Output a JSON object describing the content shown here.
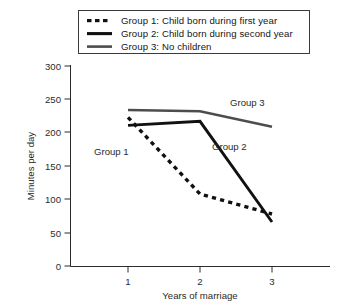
{
  "legend": {
    "items": [
      {
        "swatch": "dotted-line-swatch",
        "label": "Group 1: Child born during first year"
      },
      {
        "swatch": "solid-thick-line-swatch",
        "label": "Group 2: Child born during second year"
      },
      {
        "swatch": "solid-gray-line-swatch",
        "label": "Group 3: No children"
      }
    ]
  },
  "chart_data": {
    "type": "line",
    "title": "",
    "xlabel": "Years of marriage",
    "ylabel": "Minutes per day",
    "categories": [
      "1",
      "2",
      "3"
    ],
    "x": [
      1,
      2,
      3
    ],
    "xlim": [
      0.55,
      3.45
    ],
    "ylim": [
      0,
      300
    ],
    "yticks": [
      0,
      50,
      100,
      150,
      200,
      250,
      300
    ],
    "xticks": [
      "1",
      "2",
      "3"
    ],
    "grid": false,
    "legend_position": "top",
    "series": [
      {
        "name": "Group 1: Child born during first year",
        "short_name": "Group 1",
        "style": "dotted",
        "color": "#111111",
        "values": [
          223,
          108,
          78
        ]
      },
      {
        "name": "Group 2: Child born during second year",
        "short_name": "Group 2",
        "style": "solid",
        "color": "#111111",
        "values": [
          211,
          217,
          66
        ]
      },
      {
        "name": "Group 3: No children",
        "short_name": "Group 3",
        "style": "solid",
        "color": "#4d4d4d",
        "values": [
          234,
          232,
          209
        ]
      }
    ],
    "annotations": [
      {
        "text": "Group 1",
        "x": 1.18,
        "y": 152
      },
      {
        "text": "Group 2",
        "x": 2.22,
        "y": 176
      },
      {
        "text": "Group 3",
        "x": 2.42,
        "y": 232
      }
    ]
  },
  "axes": {
    "y_tick_labels": [
      "300",
      "250",
      "200",
      "150",
      "100",
      "50",
      "0"
    ],
    "x_tick_labels": [
      "1",
      "2",
      "3"
    ],
    "y_axis_title": "Minutes per day",
    "x_axis_title": "Years of marriage"
  }
}
